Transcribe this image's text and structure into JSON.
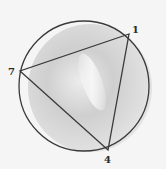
{
  "diagram": {
    "type": "circle-inscribed-triangle",
    "circle": {
      "cx": 84,
      "cy": 86,
      "r": 65,
      "stroke": "#3a3a3a"
    },
    "vertices": [
      {
        "label": "1",
        "x": 129,
        "y": 34,
        "lx": 132,
        "ly": 33
      },
      {
        "label": "7",
        "x": 20,
        "y": 71,
        "lx": 8,
        "ly": 75
      },
      {
        "label": "4",
        "x": 108,
        "y": 150,
        "lx": 104,
        "ly": 163
      }
    ],
    "edges": [
      [
        "1",
        "7"
      ],
      [
        "7",
        "4"
      ],
      [
        "4",
        "1"
      ]
    ],
    "colors": {
      "background": "#f5f5f5",
      "shading": "#b8b8b8",
      "stroke": "#3a3a3a"
    }
  }
}
